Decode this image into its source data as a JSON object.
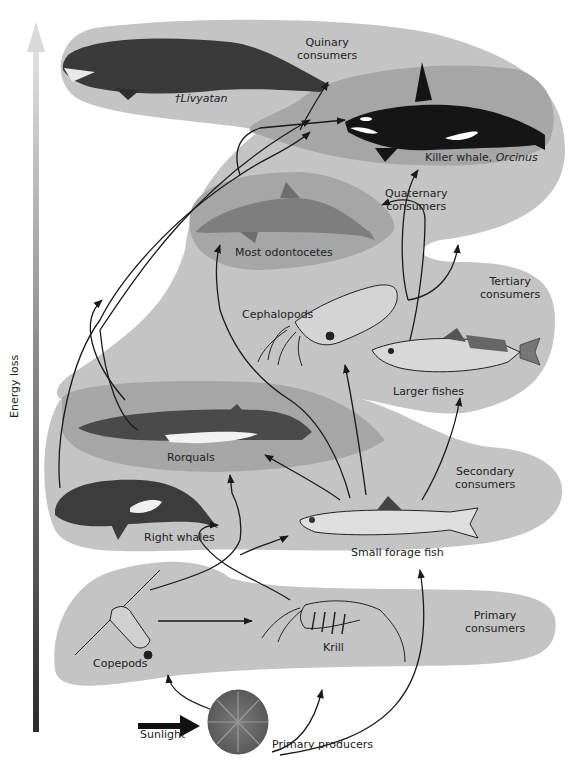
{
  "axis": {
    "label": "Energy loss",
    "gradient_top": "#d9d9d9",
    "gradient_bottom": "#2b2b2b"
  },
  "colors": {
    "band_light": "#c4c4c4",
    "band_dark": "#9e9e9e",
    "arrow": "#1a1a1a"
  },
  "levels": [
    {
      "id": "quinary",
      "line1": "Quinary",
      "line2": "consumers"
    },
    {
      "id": "quaternary",
      "line1": "Quaternary",
      "line2": "consumers"
    },
    {
      "id": "tertiary",
      "line1": "Tertiary",
      "line2": "consumers"
    },
    {
      "id": "secondary",
      "line1": "Secondary",
      "line2": "consumers"
    },
    {
      "id": "primary",
      "line1": "Primary",
      "line2": "consumers"
    },
    {
      "id": "producers",
      "line1": "Primary producers"
    }
  ],
  "organisms": {
    "livyatan": {
      "prefix": "†",
      "name": "Livyatan"
    },
    "orca": {
      "name": "Killer whale, ",
      "genus": "Orcinus"
    },
    "odontocetes": {
      "name": "Most odontocetes"
    },
    "cephalopods": {
      "name": "Cephalopods"
    },
    "larger_fishes": {
      "name": "Larger fishes"
    },
    "rorquals": {
      "name": "Rorquals"
    },
    "right_whales": {
      "name": "Right whales"
    },
    "forage_fish": {
      "name": "Small forage fish"
    },
    "copepods": {
      "name": "Copepods"
    },
    "krill": {
      "name": "Krill"
    },
    "sunlight": {
      "name": "Sunlight"
    }
  }
}
